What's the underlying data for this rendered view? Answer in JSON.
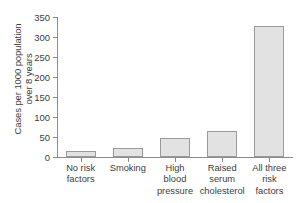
{
  "chart_data": {
    "type": "bar",
    "title": "",
    "subtitle": "",
    "xlabel": "",
    "ylabel": "Cases per 1000 population over 8 years",
    "ylabel_lines": [
      "Cases per 1000 population",
      "over 8 years"
    ],
    "categories": [
      "No risk factors",
      "Smoking",
      "High blood pressure",
      "Raised serum cholesterol",
      "All three risk factors"
    ],
    "category_lines": [
      [
        "No risk",
        "factors"
      ],
      [
        "Smoking"
      ],
      [
        "High",
        "blood",
        "pressure"
      ],
      [
        "Raised",
        "serum",
        "cholesterol"
      ],
      [
        "All three",
        "risk",
        "factors"
      ]
    ],
    "values": [
      15,
      22,
      48,
      65,
      327
    ],
    "ylim": [
      0,
      350
    ],
    "yticks": [
      0,
      50,
      100,
      150,
      200,
      250,
      300,
      350
    ],
    "ytick_labels": [
      "0",
      "50",
      "100",
      "150",
      "200",
      "250",
      "300",
      "350"
    ],
    "grid": false,
    "legend": false,
    "legend_position": "none",
    "colors": {
      "bar_fill": "#e2e2e2",
      "bar_stroke": "#9a9a9a",
      "axis": "#8c8c8c",
      "text": "#3c3c3c",
      "background": "#ffffff"
    }
  }
}
